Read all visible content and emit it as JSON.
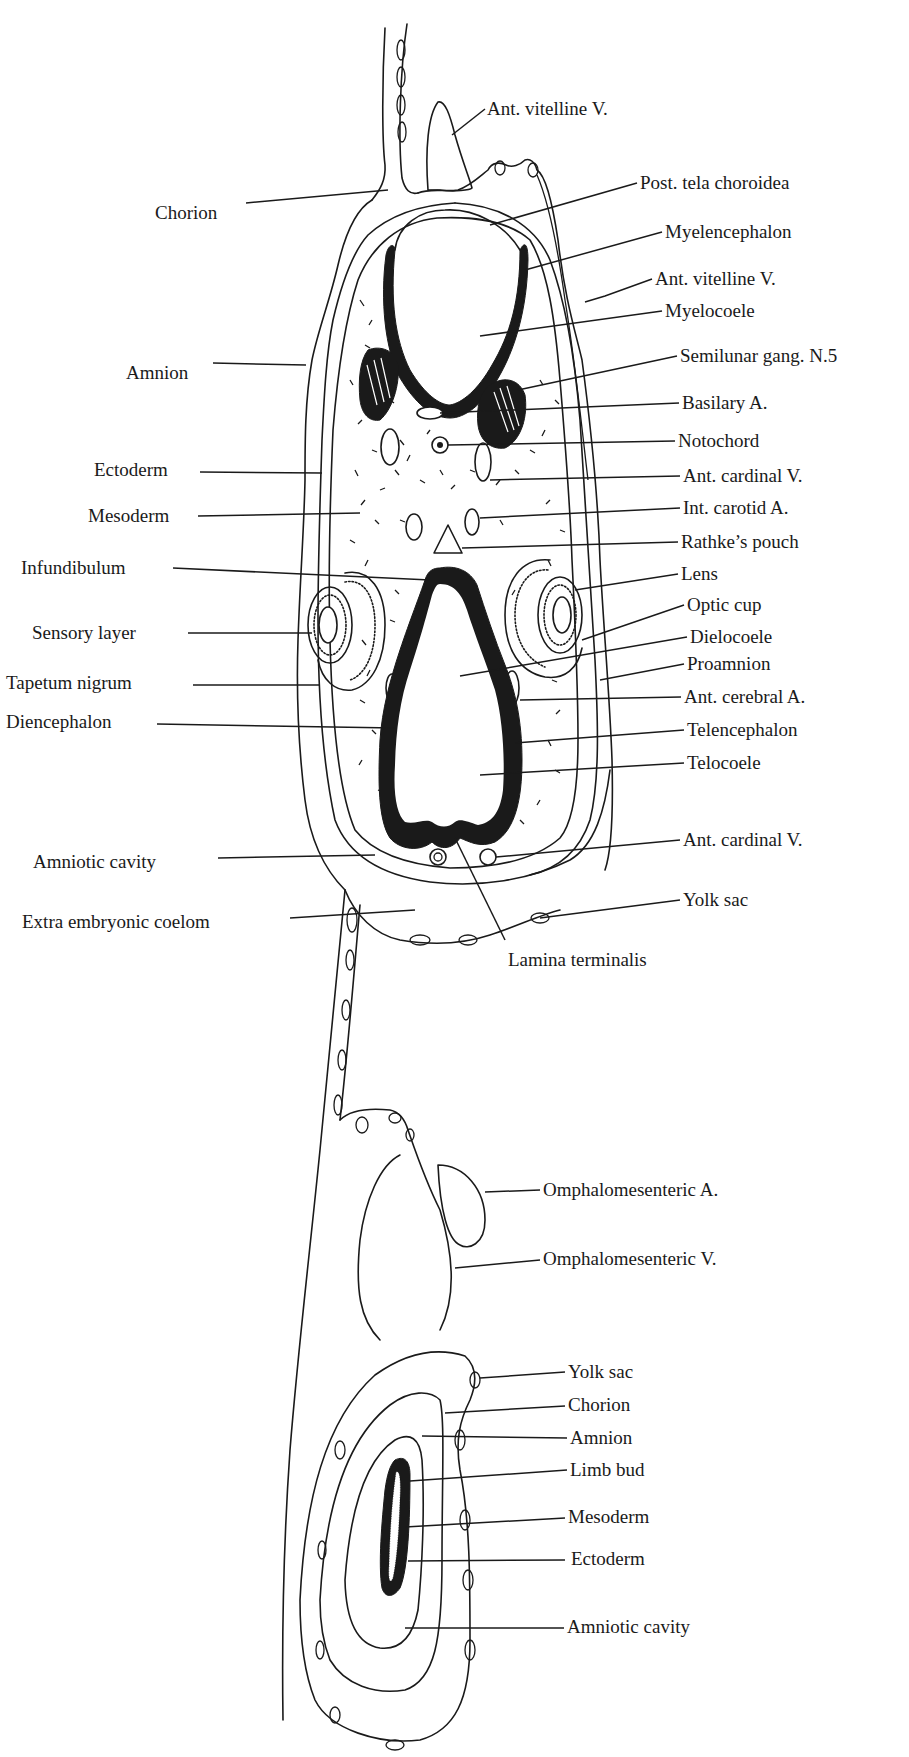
{
  "figure": {
    "line_color": "#1a1a1a",
    "background": "#ffffff"
  },
  "labels": {
    "upper_right": [
      {
        "id": "ant-vitelline-v-top",
        "text": "Ant. vitelline V.",
        "x": 487,
        "y": 109
      },
      {
        "id": "post-tela-choroidea",
        "text": "Post. tela choroidea",
        "x": 640,
        "y": 183
      },
      {
        "id": "myelencephalon",
        "text": "Myelencephalon",
        "x": 665,
        "y": 232
      },
      {
        "id": "ant-vitelline-v",
        "text": "Ant. vitelline V.",
        "x": 655,
        "y": 279
      },
      {
        "id": "myelocoele",
        "text": "Myelocoele",
        "x": 665,
        "y": 311
      },
      {
        "id": "semilunar-gang",
        "text": "Semilunar gang. N.5",
        "x": 680,
        "y": 356
      },
      {
        "id": "basilary-a",
        "text": "Basilary A.",
        "x": 682,
        "y": 403
      },
      {
        "id": "notochord",
        "text": "Notochord",
        "x": 678,
        "y": 441
      },
      {
        "id": "ant-cardinal-v-1",
        "text": "Ant. cardinal V.",
        "x": 683,
        "y": 476
      },
      {
        "id": "int-carotid-a",
        "text": "Int. carotid A.",
        "x": 683,
        "y": 508
      },
      {
        "id": "rathkes-pouch",
        "text": "Rathke’s pouch",
        "x": 681,
        "y": 542
      },
      {
        "id": "lens",
        "text": "Lens",
        "x": 681,
        "y": 574
      },
      {
        "id": "optic-cup",
        "text": "Optic cup",
        "x": 687,
        "y": 605
      },
      {
        "id": "dielocoele",
        "text": "Dielocoele",
        "x": 690,
        "y": 637
      },
      {
        "id": "proamnion",
        "text": "Proamnion",
        "x": 687,
        "y": 664
      },
      {
        "id": "ant-cerebral-a",
        "text": "Ant. cerebral A.",
        "x": 684,
        "y": 697
      },
      {
        "id": "telencephalon",
        "text": "Telencephalon",
        "x": 687,
        "y": 730
      },
      {
        "id": "telocoele",
        "text": "Telocoele",
        "x": 687,
        "y": 763
      },
      {
        "id": "ant-cardinal-v-2",
        "text": "Ant. cardinal V.",
        "x": 683,
        "y": 840
      },
      {
        "id": "yolk-sac-1",
        "text": "Yolk sac",
        "x": 683,
        "y": 900
      }
    ],
    "upper_left": [
      {
        "id": "chorion",
        "text": "Chorion",
        "x": 243,
        "y": 203
      },
      {
        "id": "amnion",
        "text": "Amnion",
        "x": 210,
        "y": 363
      },
      {
        "id": "ectoderm",
        "text": "Ectoderm",
        "x": 197,
        "y": 460
      },
      {
        "id": "mesoderm",
        "text": "Mesoderm",
        "x": 195,
        "y": 512
      },
      {
        "id": "infundibulum",
        "text": "Infundibulum",
        "x": 170,
        "y": 562
      },
      {
        "id": "sensory-layer",
        "text": "Sensory layer",
        "x": 175,
        "y": 627
      },
      {
        "id": "tapetum-nigrum",
        "text": "Tapetum nigrum",
        "x": 185,
        "y": 677
      },
      {
        "id": "diencephalon",
        "text": "Diencephalon",
        "x": 152,
        "y": 711
      },
      {
        "id": "amniotic-cavity-1",
        "text": "Amniotic cavity",
        "x": 202,
        "y": 856
      },
      {
        "id": "extra-embryonic-coelom",
        "text": "Extra embryonic coelom",
        "x": 286,
        "y": 916
      }
    ],
    "center": [
      {
        "id": "lamina-terminalis",
        "text": "Lamina terminalis",
        "x": 508,
        "y": 955
      }
    ],
    "lower_right": [
      {
        "id": "omphalomesenteric-a",
        "text": "Omphalomesenteric A.",
        "x": 543,
        "y": 1179
      },
      {
        "id": "omphalomesenteric-v",
        "text": "Omphalomesenteric V.",
        "x": 543,
        "y": 1248
      },
      {
        "id": "yolk-sac-2",
        "text": "Yolk sac",
        "x": 568,
        "y": 1361
      },
      {
        "id": "chorion-2",
        "text": "Chorion",
        "x": 568,
        "y": 1395
      },
      {
        "id": "amnion-2",
        "text": "Amnion",
        "x": 570,
        "y": 1428
      },
      {
        "id": "limb-bud",
        "text": "Limb bud",
        "x": 570,
        "y": 1460
      },
      {
        "id": "mesoderm-2",
        "text": "Mesoderm",
        "x": 568,
        "y": 1507
      },
      {
        "id": "ectoderm-2",
        "text": "Ectoderm",
        "x": 571,
        "y": 1549
      },
      {
        "id": "amniotic-cavity-2",
        "text": "Amniotic cavity",
        "x": 567,
        "y": 1618
      }
    ]
  }
}
